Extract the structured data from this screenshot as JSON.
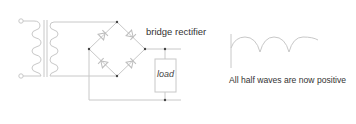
{
  "labels": {
    "bridge": "bridge rectifier",
    "load": "load",
    "caption": "All half waves are now positive"
  },
  "colors": {
    "wire": "#c8c8c8",
    "node": "#444444",
    "text": "#333333",
    "waveform": "#c8c8c8"
  },
  "components": {
    "transformer": {
      "primary_turns": 4,
      "secondary_turns": 4
    },
    "bridge": {
      "diodes": 4
    },
    "load": {
      "type": "resistor-box"
    }
  },
  "waveform": {
    "type": "full-wave-rectified",
    "visible_half_waves": 3
  }
}
